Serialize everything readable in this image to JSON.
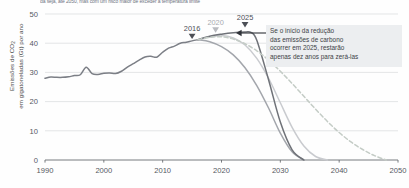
{
  "caption": "da seja, até 2050, mas com um risco maior de exceder a temperatura limite",
  "axis": {
    "y_title_line1": "Emissões de CO",
    "y_title_sub": "2",
    "y_title_line2": "em gigatoneladas (Gt) por ano",
    "y_ticks": [
      "0",
      "10",
      "20",
      "30",
      "40",
      "50"
    ],
    "x_ticks": [
      "1990",
      "2000",
      "2010",
      "2020",
      "2030",
      "2040",
      "2050"
    ]
  },
  "markers": [
    {
      "label": "2016",
      "year": 2015,
      "color": "#4c4f56"
    },
    {
      "label": "2020",
      "year": 2019,
      "color": "#b9bbc0"
    },
    {
      "label": "2025",
      "year": 2024,
      "color": "#4c4f56"
    }
  ],
  "annotation": {
    "line1": "Se o início da redução",
    "line2": "das emissões de carbono",
    "line3": "ocorrer em 2025, restarão",
    "line4": "apenas dez anos para zerá-las",
    "background": "#eceef0"
  },
  "colors": {
    "historical": "#7c7f86",
    "scenario_2016": "#a3a6ac",
    "scenario_2020": "#c9cbcf",
    "scenario_2025": "#6f7278",
    "scenario_dashed": "#c4ccc6",
    "gridline": "#d9dbdd",
    "axis": "#6a6d72"
  },
  "chart_data": {
    "type": "line",
    "title": "",
    "xlabel": "",
    "ylabel": "Emissões de CO2 em gigatoneladas (Gt) por ano",
    "xlim": [
      1990,
      2050
    ],
    "ylim": [
      0,
      50
    ],
    "grid": true,
    "legend": "none",
    "series": [
      {
        "name": "Emissões históricas",
        "style": "solid",
        "color": "#7c7f86",
        "x": [
          1990,
          1991,
          1992,
          1993,
          1994,
          1995,
          1996,
          1997,
          1998,
          1999,
          2000,
          2001,
          2002,
          2003,
          2004,
          2005,
          2006,
          2007,
          2008,
          2009,
          2010,
          2011,
          2012,
          2013,
          2014,
          2015,
          2016
        ],
        "values": [
          28.0,
          28.4,
          28.3,
          28.3,
          28.5,
          28.9,
          29.2,
          31.8,
          29.6,
          29.3,
          29.7,
          29.8,
          29.6,
          30.4,
          31.8,
          33.0,
          34.2,
          35.3,
          35.5,
          35.2,
          36.9,
          38.3,
          39.0,
          40.0,
          40.3,
          40.8,
          41.2
        ]
      },
      {
        "name": "Redução a partir de 2016",
        "style": "solid",
        "color": "#a3a6ac",
        "x": [
          2016,
          2018,
          2020,
          2022,
          2024,
          2026,
          2028,
          2030,
          2032,
          2034
        ],
        "values": [
          41.2,
          40.5,
          38.8,
          36.0,
          31.6,
          25.5,
          17.8,
          9.2,
          2.8,
          0.0
        ]
      },
      {
        "name": "Redução a partir de 2020",
        "style": "solid",
        "color": "#c9cbcf",
        "x": [
          2016,
          2018,
          2020,
          2022,
          2024,
          2026,
          2028,
          2030,
          2032,
          2034,
          2036,
          2038
        ],
        "values": [
          41.2,
          42.1,
          42.6,
          41.8,
          39.4,
          34.8,
          28.0,
          19.6,
          11.2,
          4.8,
          1.2,
          0.0
        ]
      },
      {
        "name": "Redução a partir de 2025",
        "style": "solid",
        "color": "#6f7278",
        "x": [
          2016,
          2018,
          2020,
          2022,
          2024,
          2025,
          2026,
          2028,
          2030,
          2032,
          2034
        ],
        "values": [
          41.2,
          42.4,
          43.1,
          43.6,
          43.8,
          43.7,
          41.0,
          27.5,
          13.0,
          3.5,
          0.0
        ]
      },
      {
        "name": "Cenário tardio (tracejado)",
        "style": "dashed",
        "color": "#c4ccc6",
        "x": [
          2016,
          2018,
          2020,
          2022,
          2024,
          2026,
          2028,
          2030,
          2032,
          2034,
          2036,
          2038,
          2040,
          2042,
          2044,
          2046,
          2048
        ],
        "values": [
          41.2,
          42.0,
          42.2,
          41.4,
          39.8,
          37.4,
          34.2,
          30.4,
          26.2,
          21.8,
          17.4,
          13.2,
          9.4,
          6.2,
          3.6,
          1.5,
          0.0
        ]
      }
    ]
  }
}
